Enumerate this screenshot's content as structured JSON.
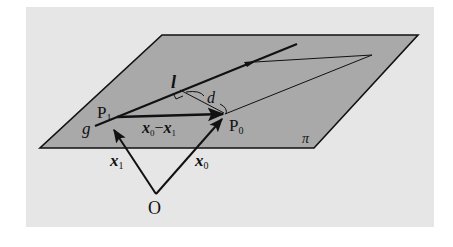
{
  "colors": {
    "page_background": "#ffffff",
    "panel_background": "#e6e6e6",
    "plane_fill": "#a9a9a9",
    "stroke": "#111111"
  },
  "labels": {
    "plane": "π",
    "line": "g",
    "direction_vector": "l",
    "distance": "d",
    "point_1": "P",
    "point_1_sub": "1",
    "point_0": "P",
    "point_0_sub": "0",
    "origin": "O",
    "vector_x1": "x",
    "vector_x1_sub": "1",
    "vector_x0": "x",
    "vector_x0_sub": "0",
    "difference_a": "x",
    "difference_a_sub": "0",
    "difference_minus": "−",
    "difference_b": "x",
    "difference_b_sub": "1"
  }
}
